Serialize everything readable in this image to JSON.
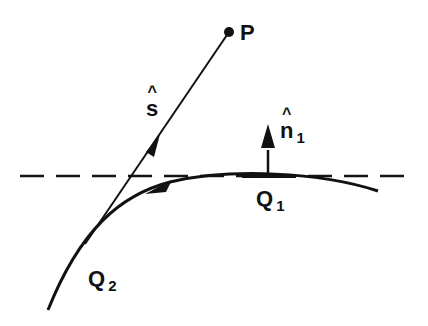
{
  "diagram": {
    "labels": {
      "point_p": "P",
      "vector_s": "s",
      "normal_n": "n",
      "normal_n_sub": "1",
      "point_q1": "Q",
      "point_q1_sub": "1",
      "point_q2": "Q",
      "point_q2_sub": "2"
    },
    "colors": {
      "ink": "#111111",
      "background": "#ffffff"
    }
  }
}
